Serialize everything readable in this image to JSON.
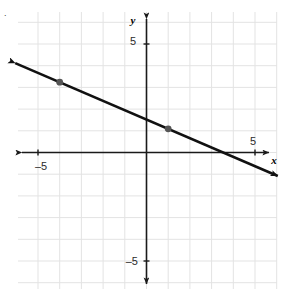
{
  "figure": {
    "name": "coordinate-plane-line-graph",
    "background_color": "#ffffff",
    "corner_mark": "."
  },
  "chart_data": {
    "type": "line",
    "title": "",
    "subtitle": "",
    "xlabel": "x",
    "ylabel": "y",
    "xlim": [
      -5.9,
      6.05
    ],
    "ylim": [
      -6.45,
      6.45
    ],
    "grid": true,
    "grid_step": 1,
    "grid_color": "#e3e3e3",
    "axis_color": "#1a1a1a",
    "legend": "none",
    "x_tick_labels": [
      {
        "value": -5,
        "label": "–5"
      },
      {
        "value": 5,
        "label": "5"
      }
    ],
    "y_tick_labels": [
      {
        "value": 5,
        "label": "5"
      },
      {
        "value": -5,
        "label": "–5"
      }
    ],
    "series": [
      {
        "name": "line",
        "color": "#111111",
        "slope": -0.43,
        "intercept": 1.52,
        "x_endpoints": [
          -6.05,
          6.05
        ],
        "y_endpoints": [
          4.12,
          -1.08
        ],
        "arrow_start": true,
        "arrow_end": true
      }
    ],
    "points": [
      {
        "label": "point-a",
        "x": -4,
        "y": 3,
        "color": "#555555"
      },
      {
        "label": "point-b",
        "x": 1,
        "y": 1,
        "color": "#555555"
      }
    ]
  }
}
